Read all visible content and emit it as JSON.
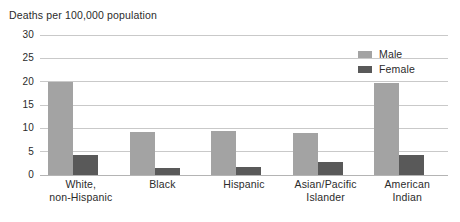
{
  "chart_data": {
    "type": "bar",
    "title": "Deaths per 100,000 population",
    "xlabel": "",
    "ylabel": "",
    "ylim": [
      0,
      30
    ],
    "yticks": [
      0,
      5,
      10,
      15,
      20,
      25,
      30
    ],
    "grid": true,
    "legend_position": "top-right",
    "categories": [
      "White, non-Hispanic",
      "Black",
      "Hispanic",
      "Asian/Pacific Islander",
      "American Indian"
    ],
    "category_lines": [
      [
        "White,",
        "non-Hispanic"
      ],
      [
        "Black",
        ""
      ],
      [
        "Hispanic",
        ""
      ],
      [
        "Asian/Pacific",
        "Islander"
      ],
      [
        "American",
        "Indian"
      ]
    ],
    "series": [
      {
        "name": "Male",
        "color": "#a3a3a3",
        "values": [
          20.0,
          9.3,
          9.5,
          9.0,
          19.7
        ]
      },
      {
        "name": "Female",
        "color": "#595959",
        "values": [
          4.3,
          1.5,
          1.7,
          2.8,
          4.3
        ]
      }
    ]
  },
  "legend": {
    "items": [
      {
        "label": "Male"
      },
      {
        "label": "Female"
      }
    ]
  },
  "colors": {
    "male": "#a3a3a3",
    "female": "#595959",
    "gridline": "#c9c9c9",
    "baseline": "#b4b4b4",
    "text": "#2b2b2b",
    "background": "#ffffff"
  }
}
